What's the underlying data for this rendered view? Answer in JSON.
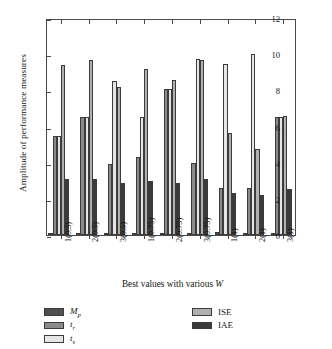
{
  "chart_data": {
    "type": "bar",
    "title": "",
    "xlabel": "Best values with various W",
    "ylabel": "Amplitude of performance measures",
    "categories": [
      "1(0.5)",
      "2(0.5)",
      "3(0.5)",
      "1(0.75)",
      "2(0.75)",
      "3(0.75)",
      "1(1)",
      "2(1)",
      "3(1)"
    ],
    "ylim": [
      0,
      12
    ],
    "yticks": [
      0,
      2,
      4,
      6,
      8,
      10,
      12
    ],
    "grid": false,
    "legend_position": "below-plot",
    "series": [
      {
        "name": "Mp",
        "label": "M_p",
        "color": "#4f4f4f",
        "values": [
          0.02,
          0.02,
          0.05,
          0.05,
          0.05,
          0.05,
          0.15,
          0.12,
          0.05
        ]
      },
      {
        "name": "tr",
        "label": "t_r",
        "color": "#8a8a8a",
        "values": [
          5.5,
          6.5,
          3.9,
          4.3,
          8.05,
          4.0,
          2.6,
          2.6,
          6.5
        ]
      },
      {
        "name": "ts",
        "label": "t_s",
        "color": "#e6e6e6",
        "values": [
          5.5,
          6.5,
          8.5,
          6.55,
          8.05,
          9.75,
          9.45,
          10.0,
          6.5
        ]
      },
      {
        "name": "ISE",
        "label": "ISE",
        "color": "#b0b0b0",
        "values": [
          9.4,
          9.7,
          8.2,
          9.2,
          8.55,
          9.7,
          5.65,
          4.75,
          6.6
        ]
      },
      {
        "name": "IAE",
        "label": "IAE",
        "color": "#3a3a3a",
        "values": [
          3.1,
          3.1,
          2.85,
          3.0,
          2.9,
          3.1,
          2.35,
          2.2,
          2.55
        ]
      }
    ]
  },
  "legend": {
    "left_items": [
      {
        "label": "M",
        "sub": "p",
        "name": "Mp"
      },
      {
        "label": "t",
        "sub": "r",
        "name": "tr"
      },
      {
        "label": "t",
        "sub": "s",
        "name": "ts"
      }
    ],
    "right_items": [
      {
        "label": "ISE",
        "sub": "",
        "name": "ISE"
      },
      {
        "label": "IAE",
        "sub": "",
        "name": "IAE"
      }
    ]
  },
  "axis": {
    "y_label_text": "Amplitude of performance measures",
    "x_label_prefix": "Best values with various ",
    "x_label_symbol": "W"
  }
}
